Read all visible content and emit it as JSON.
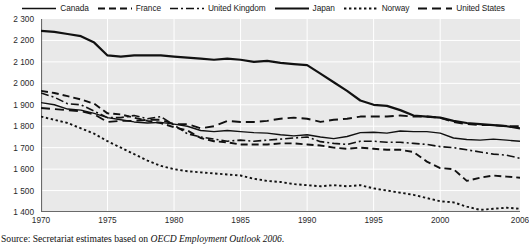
{
  "legend": {
    "items": [
      {
        "label": "Canada",
        "style": "solid-thin"
      },
      {
        "label": "France",
        "style": "dashed"
      },
      {
        "label": "United Kingdom",
        "style": "dash-dot"
      },
      {
        "label": "Japan",
        "style": "solid-thick"
      },
      {
        "label": "Norway",
        "style": "dotted"
      },
      {
        "label": "United States",
        "style": "long-dash"
      }
    ]
  },
  "source": {
    "prefix": "Source:",
    "text_before": " Secretariat estimates based on ",
    "italic": "OECD Employment Outlook 2006",
    "text_after": "."
  },
  "chart_data": {
    "type": "line",
    "title": "",
    "xlabel": "",
    "ylabel": "",
    "xlim": [
      1970,
      2006
    ],
    "ylim": [
      1400,
      2300
    ],
    "yticks": [
      1400,
      1500,
      1600,
      1700,
      1800,
      1900,
      2000,
      2100,
      2200,
      2300
    ],
    "ytick_labels": [
      "1 400",
      "1 500",
      "1 600",
      "1 700",
      "1 800",
      "1 900",
      "2 000",
      "2 100",
      "2 200",
      "2 300"
    ],
    "xticks": [
      1970,
      1975,
      1980,
      1985,
      1990,
      1995,
      2000,
      2006
    ],
    "xtick_labels": [
      "1970",
      "1975",
      "1980",
      "1985",
      "1990",
      "1995",
      "2000",
      "2006"
    ],
    "grid": true,
    "legend_position": "top",
    "x": [
      1970,
      1971,
      1972,
      1973,
      1974,
      1975,
      1976,
      1977,
      1978,
      1979,
      1980,
      1981,
      1982,
      1983,
      1984,
      1985,
      1986,
      1987,
      1988,
      1989,
      1990,
      1991,
      1992,
      1993,
      1994,
      1995,
      1996,
      1997,
      1998,
      1999,
      2000,
      2001,
      2002,
      2003,
      2004,
      2005,
      2006
    ],
    "series": [
      {
        "name": "Canada",
        "style": "solid-thin",
        "values": [
          1910,
          1900,
          1880,
          1875,
          1860,
          1840,
          1830,
          1820,
          1815,
          1818,
          1810,
          1800,
          1780,
          1775,
          1780,
          1775,
          1770,
          1768,
          1760,
          1755,
          1760,
          1750,
          1742,
          1752,
          1770,
          1772,
          1768,
          1778,
          1775,
          1775,
          1768,
          1745,
          1738,
          1735,
          1740,
          1735,
          1730
        ]
      },
      {
        "name": "France",
        "style": "dashed",
        "values": [
          1965,
          1955,
          1940,
          1925,
          1905,
          1860,
          1855,
          1840,
          1825,
          1815,
          1795,
          1780,
          1745,
          1730,
          1725,
          1715,
          1715,
          1715,
          1720,
          1720,
          1715,
          1710,
          1700,
          1695,
          1700,
          1695,
          1690,
          1690,
          1680,
          1635,
          1605,
          1600,
          1545,
          1560,
          1570,
          1565,
          1560
        ]
      },
      {
        "name": "United Kingdom",
        "style": "dash-dot",
        "values": [
          1955,
          1935,
          1905,
          1900,
          1870,
          1840,
          1840,
          1850,
          1835,
          1845,
          1805,
          1765,
          1750,
          1740,
          1730,
          1735,
          1730,
          1735,
          1740,
          1745,
          1750,
          1728,
          1720,
          1715,
          1730,
          1730,
          1725,
          1725,
          1720,
          1715,
          1705,
          1700,
          1690,
          1680,
          1670,
          1665,
          1650
        ]
      },
      {
        "name": "Japan",
        "style": "solid-thick",
        "values": [
          2245,
          2240,
          2230,
          2220,
          2190,
          2130,
          2125,
          2130,
          2130,
          2130,
          2125,
          2120,
          2115,
          2110,
          2115,
          2110,
          2100,
          2105,
          2095,
          2090,
          2085,
          2045,
          2005,
          1965,
          1920,
          1900,
          1895,
          1875,
          1850,
          1845,
          1840,
          1825,
          1815,
          1810,
          1805,
          1800,
          1790
        ]
      },
      {
        "name": "Norway",
        "style": "dotted",
        "values": [
          1845,
          1830,
          1815,
          1790,
          1765,
          1730,
          1700,
          1670,
          1640,
          1615,
          1600,
          1590,
          1585,
          1580,
          1575,
          1570,
          1555,
          1545,
          1540,
          1530,
          1525,
          1520,
          1525,
          1520,
          1525,
          1510,
          1500,
          1490,
          1480,
          1465,
          1450,
          1445,
          1425,
          1410,
          1415,
          1420,
          1415
        ]
      },
      {
        "name": "United States",
        "style": "long-dash",
        "values": [
          1885,
          1880,
          1875,
          1870,
          1855,
          1820,
          1825,
          1825,
          1830,
          1830,
          1810,
          1810,
          1790,
          1800,
          1825,
          1820,
          1820,
          1825,
          1835,
          1840,
          1835,
          1820,
          1830,
          1835,
          1845,
          1845,
          1845,
          1850,
          1845,
          1845,
          1840,
          1820,
          1810,
          1805,
          1805,
          1800,
          1800
        ]
      }
    ]
  }
}
